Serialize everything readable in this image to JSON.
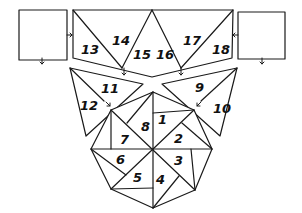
{
  "diagram": {
    "type": "hand-drawn piecing / folding pattern",
    "colors": {
      "line": "#1a1a1a",
      "background": "#ffffff",
      "text": "#111111"
    },
    "pieces": [
      {
        "label": "1",
        "x": 158,
        "y": 122
      },
      {
        "label": "2",
        "x": 176,
        "y": 139
      },
      {
        "label": "3",
        "x": 176,
        "y": 164
      },
      {
        "label": "4",
        "x": 158,
        "y": 182
      },
      {
        "label": "5",
        "x": 135,
        "y": 180
      },
      {
        "label": "6",
        "x": 118,
        "y": 163
      },
      {
        "label": "7",
        "x": 121,
        "y": 143
      },
      {
        "label": "8",
        "x": 140,
        "y": 126
      },
      {
        "label": "9",
        "x": 197,
        "y": 89
      },
      {
        "label": "10",
        "x": 217,
        "y": 107
      },
      {
        "label": "11",
        "x": 99,
        "y": 89
      },
      {
        "label": "12",
        "x": 78,
        "y": 107
      },
      {
        "label": "13",
        "x": 80,
        "y": 53
      },
      {
        "label": "14",
        "x": 112,
        "y": 42
      },
      {
        "label": "15",
        "x": 134,
        "y": 58
      },
      {
        "label": "16",
        "x": 157,
        "y": 58
      },
      {
        "label": "17",
        "x": 180,
        "y": 43
      },
      {
        "label": "18",
        "x": 212,
        "y": 53
      }
    ],
    "blank_squares": [
      "left-square",
      "right-square"
    ],
    "arrows": [
      "left-square-to-banner",
      "right-square-to-banner",
      "left-square-down",
      "right-square-down",
      "banner-left-down",
      "banner-right-down",
      "left-wing-to-octagon",
      "right-wing-to-octagon"
    ]
  }
}
